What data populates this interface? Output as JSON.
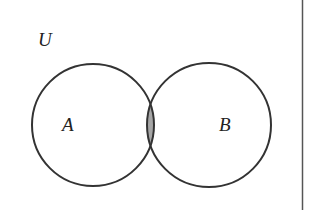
{
  "diagram": {
    "type": "venn",
    "universe_label": "U",
    "sets": [
      {
        "name": "A",
        "label": "A",
        "cx": 93,
        "cy": 125,
        "r": 61
      },
      {
        "name": "B",
        "label": "B",
        "cx": 209,
        "cy": 125,
        "r": 62
      }
    ],
    "shaded_region": "A ∩ B",
    "colors": {
      "stroke": "#333333",
      "shade": "#a6a6a6",
      "background": "#ffffff",
      "border": "#555555"
    }
  }
}
